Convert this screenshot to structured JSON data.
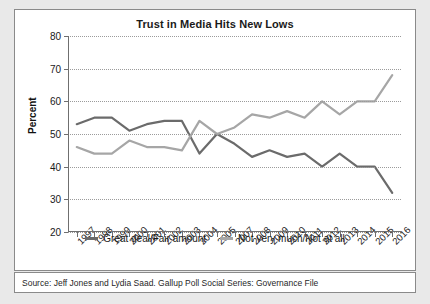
{
  "chart_data": {
    "type": "line",
    "title": "Trust in Media Hits New Lows",
    "xlabel": "",
    "ylabel": "Percent",
    "ylim": [
      20,
      80
    ],
    "yticks": [
      20,
      30,
      40,
      50,
      60,
      70,
      80
    ],
    "grid": true,
    "legend_position": "bottom",
    "categories": [
      "1997",
      "1998",
      "1999",
      "2000",
      "2001",
      "2002",
      "2003",
      "2004",
      "2005",
      "2007",
      "2008",
      "2009",
      "2010",
      "2011",
      "2012",
      "2013",
      "2014",
      "2015",
      "2016"
    ],
    "series": [
      {
        "name": "Great deal/Fair amount",
        "color": "#6b6b6b",
        "values": [
          53,
          55,
          55,
          51,
          53,
          54,
          54,
          44,
          50,
          47,
          43,
          45,
          43,
          44,
          40,
          44,
          40,
          40,
          32
        ]
      },
      {
        "name": "Not very much/Not at all",
        "color": "#a6a6a6",
        "values": [
          46,
          44,
          44,
          48,
          46,
          46,
          45,
          54,
          50,
          52,
          56,
          55,
          57,
          55,
          60,
          56,
          60,
          60,
          68
        ]
      }
    ]
  },
  "source": {
    "text": "Source: Jeff Jones and Lydia Saad. Gallup Poll Social Series: Governance File"
  }
}
